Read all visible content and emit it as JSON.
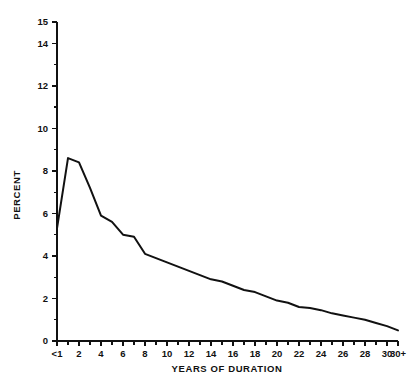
{
  "chart_data": {
    "type": "line",
    "title": "",
    "subtitle": "",
    "xlabel": "YEARS OF DURATION",
    "ylabel": "PERCENT",
    "xlim": [
      0,
      31
    ],
    "ylim": [
      0,
      15
    ],
    "grid": false,
    "legend": null,
    "x_tick_labels": [
      "<1",
      "2",
      "4",
      "6",
      "8",
      "10",
      "12",
      "14",
      "16",
      "18",
      "20",
      "22",
      "24",
      "26",
      "28",
      "30",
      "30+"
    ],
    "x_tick_positions": [
      0,
      2,
      4,
      6,
      8,
      10,
      12,
      14,
      16,
      18,
      20,
      22,
      24,
      26,
      28,
      30,
      31
    ],
    "x_minor_tick_positions": [
      1,
      3,
      5,
      7,
      9,
      11,
      13,
      15,
      17,
      19,
      21,
      23,
      25,
      27,
      29
    ],
    "y_tick_labels": [
      "0",
      "2",
      "4",
      "6",
      "8",
      "10",
      "12",
      "14",
      "15"
    ],
    "y_tick_positions": [
      0,
      2,
      4,
      6,
      8,
      10,
      12,
      14,
      15
    ],
    "y_minor_tick_positions": [
      1,
      3,
      5,
      7,
      9,
      11,
      13
    ],
    "categories": [
      "<1",
      "1",
      "2",
      "3",
      "4",
      "5",
      "6",
      "7",
      "8",
      "9",
      "10",
      "11",
      "12",
      "13",
      "14",
      "15",
      "16",
      "17",
      "18",
      "19",
      "20",
      "21",
      "22",
      "23",
      "24",
      "25",
      "26",
      "27",
      "28",
      "29",
      "30",
      "30+"
    ],
    "x": [
      0,
      1,
      2,
      3,
      4,
      5,
      6,
      7,
      8,
      9,
      10,
      11,
      12,
      13,
      14,
      15,
      16,
      17,
      18,
      19,
      20,
      21,
      22,
      23,
      24,
      25,
      26,
      27,
      28,
      29,
      30,
      31
    ],
    "values": [
      5.3,
      8.6,
      8.4,
      7.2,
      5.9,
      5.6,
      5.0,
      4.9,
      4.1,
      3.9,
      3.7,
      3.5,
      3.3,
      3.1,
      2.9,
      2.8,
      2.6,
      2.4,
      2.3,
      2.1,
      1.9,
      1.8,
      1.6,
      1.55,
      1.45,
      1.3,
      1.2,
      1.1,
      1.0,
      0.85,
      0.7,
      0.5
    ],
    "series": [
      {
        "name": "percent by years of duration",
        "color": "#111111",
        "values": [
          5.3,
          8.6,
          8.4,
          7.2,
          5.9,
          5.6,
          5.0,
          4.9,
          4.1,
          3.9,
          3.7,
          3.5,
          3.3,
          3.1,
          2.9,
          2.8,
          2.6,
          2.4,
          2.3,
          2.1,
          1.9,
          1.8,
          1.6,
          1.55,
          1.45,
          1.3,
          1.2,
          1.1,
          1.0,
          0.85,
          0.7,
          0.5
        ]
      }
    ]
  },
  "colors": {
    "line": "#111111",
    "axis": "#111111",
    "background": "#ffffff"
  }
}
